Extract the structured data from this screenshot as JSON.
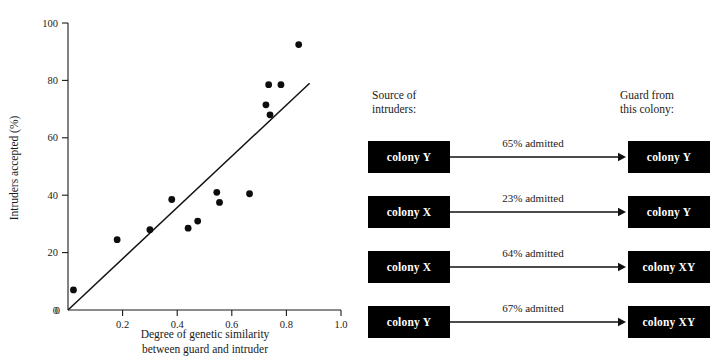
{
  "chart_data": {
    "type": "scatter",
    "title": "",
    "xlabel": "Degree of genetic similarity between guard and intruder",
    "xlabel_line1": "Degree of genetic similarity",
    "xlabel_line2": "between guard and intruder",
    "ylabel": "Intruders accepted (%)",
    "xlim": [
      0.0,
      1.0
    ],
    "ylim": [
      0,
      100
    ],
    "xticks": [
      0.0,
      0.2,
      0.4,
      0.6,
      0.8,
      1.0
    ],
    "xtick_labels": [
      "0",
      "0.2",
      "0.4",
      "0.6",
      "0.8",
      "1.0"
    ],
    "yticks": [
      0,
      20,
      40,
      60,
      80,
      100
    ],
    "ytick_labels": [
      "0",
      "20",
      "40",
      "60",
      "80",
      "100"
    ],
    "grid": false,
    "legend": "none",
    "points": [
      {
        "x": 0.02,
        "y": 7
      },
      {
        "x": 0.18,
        "y": 24.5
      },
      {
        "x": 0.3,
        "y": 28
      },
      {
        "x": 0.38,
        "y": 38.5
      },
      {
        "x": 0.44,
        "y": 28.5
      },
      {
        "x": 0.475,
        "y": 31
      },
      {
        "x": 0.545,
        "y": 41
      },
      {
        "x": 0.555,
        "y": 37.5
      },
      {
        "x": 0.665,
        "y": 40.5
      },
      {
        "x": 0.725,
        "y": 71.5
      },
      {
        "x": 0.735,
        "y": 78.5
      },
      {
        "x": 0.74,
        "y": 68
      },
      {
        "x": 0.78,
        "y": 78.5
      },
      {
        "x": 0.845,
        "y": 92.5
      }
    ],
    "trend_line": {
      "type": "line",
      "x": [
        0.0,
        0.885
      ],
      "y": [
        0,
        79
      ]
    }
  },
  "flow_diagram": {
    "heading_left_line1": "Source of",
    "heading_left_line2": "intruders:",
    "heading_right_line1": "Guard from",
    "heading_right_line2": "this colony:",
    "rows": [
      {
        "source": "colony Y",
        "label": "65% admitted",
        "guard": "colony Y"
      },
      {
        "source": "colony X",
        "label": "23% admitted",
        "guard": "colony Y"
      },
      {
        "source": "colony X",
        "label": "64% admitted",
        "guard": "colony XY"
      },
      {
        "source": "colony Y",
        "label": "67% admitted",
        "guard": "colony XY"
      }
    ]
  },
  "colors": {
    "ink": "#1a1a1a",
    "box_fill": "#000000",
    "box_text": "#ffffff",
    "point": "#0d0d0d"
  }
}
